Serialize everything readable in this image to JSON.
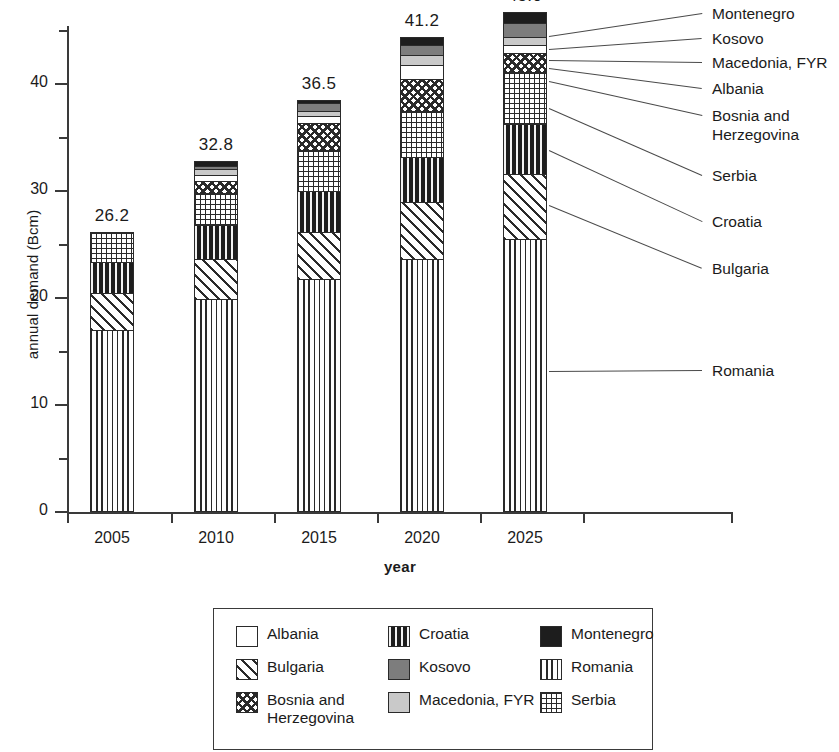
{
  "chart_data": {
    "type": "bar",
    "subtype": "stacked-bar",
    "title": "",
    "xlabel": "year",
    "ylabel": "annual demand (Bcm)",
    "categories": [
      "2005",
      "2010",
      "2015",
      "2020",
      "2025"
    ],
    "ylim": [
      0,
      46
    ],
    "yticks_major": [
      0,
      10,
      20,
      30,
      40
    ],
    "yticks_minor": [
      5,
      15,
      25,
      35,
      45
    ],
    "grid": false,
    "legend_position": "bottom",
    "bar_totals": [
      "26.2",
      "32.8",
      "36.5",
      "41.2",
      "45.0"
    ],
    "stack_order_bottom_to_top": [
      "Romania",
      "Bulgaria",
      "Croatia",
      "Serbia",
      "Bosnia and Herzegovina",
      "Albania",
      "Macedonia, FYR",
      "Kosovo",
      "Montenegro"
    ],
    "series": [
      {
        "name": "Romania",
        "values": [
          17.0,
          19.9,
          21.8,
          23.6,
          25.5
        ]
      },
      {
        "name": "Bulgaria",
        "values": [
          3.5,
          3.7,
          4.4,
          5.4,
          6.1
        ]
      },
      {
        "name": "Croatia",
        "values": [
          2.9,
          3.2,
          3.8,
          4.2,
          4.7
        ]
      },
      {
        "name": "Serbia",
        "values": [
          2.8,
          3.0,
          3.8,
          4.3,
          4.8
        ]
      },
      {
        "name": "Bosnia and Herzegovina",
        "values": [
          0.0,
          1.1,
          2.6,
          3.0,
          1.8
        ]
      },
      {
        "name": "Albania",
        "values": [
          0.0,
          0.6,
          0.6,
          1.3,
          0.7
        ]
      },
      {
        "name": "Macedonia, FYR",
        "values": [
          0.0,
          0.6,
          0.5,
          0.9,
          0.8
        ]
      },
      {
        "name": "Kosovo",
        "values": [
          0.0,
          0.2,
          0.7,
          0.9,
          1.3
        ]
      },
      {
        "name": "Montenegro",
        "values": [
          0.0,
          0.5,
          0.3,
          0.8,
          1.0
        ]
      }
    ]
  },
  "axis": {
    "y_label": "annual demand (Bcm)",
    "x_label": "year",
    "y_tick_labels": [
      "40",
      "30",
      "20",
      "10",
      "0"
    ],
    "x_tick_labels": [
      "2005",
      "2010",
      "2015",
      "2020",
      "2025"
    ]
  },
  "bar_totals": {
    "b2005": "26.2",
    "b2010": "32.8",
    "b2015": "36.5",
    "b2020": "41.2",
    "b2025": "45.0"
  },
  "callouts": [
    {
      "label": "Montenegro"
    },
    {
      "label": "Kosovo"
    },
    {
      "label": "Macedonia, FYR"
    },
    {
      "label": "Albania"
    },
    {
      "label": "Bosnia and\nHerzegovina"
    },
    {
      "label": "Serbia"
    },
    {
      "label": "Croatia"
    },
    {
      "label": "Bulgaria"
    },
    {
      "label": "Romania"
    }
  ],
  "legend": {
    "items": [
      {
        "label": "Albania",
        "pattern": "albania"
      },
      {
        "label": "Croatia",
        "pattern": "croatia"
      },
      {
        "label": "Montenegro",
        "pattern": "montenegro"
      },
      {
        "label": "Bulgaria",
        "pattern": "bulgaria"
      },
      {
        "label": "Kosovo",
        "pattern": "kosovo"
      },
      {
        "label": "Romania",
        "pattern": "romania"
      },
      {
        "label": "Bosnia and\nHerzegovina",
        "pattern": "bosnia"
      },
      {
        "label": "Macedonia, FYR",
        "pattern": "macedonia"
      },
      {
        "label": "Serbia",
        "pattern": "serbia"
      }
    ]
  },
  "colors": {
    "ink": "#1d1d1d",
    "axis": "#3a3a3a",
    "kosovo_gray": "#7d7d7d",
    "macedonia_gray": "#c9c9c9",
    "white": "#ffffff"
  }
}
